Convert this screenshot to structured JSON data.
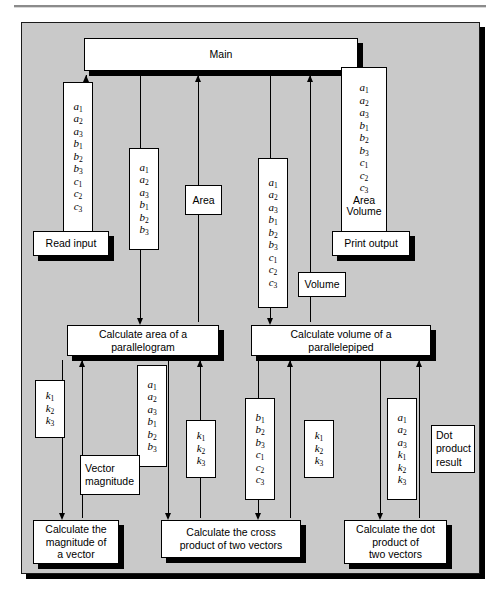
{
  "diagram": {
    "type": "structure-chart",
    "title_rule": "",
    "modules": {
      "main": "Main",
      "read_input": "Read input",
      "print_output": "Print output",
      "calc_area": "Calculate area of a\nparallelogram",
      "calc_area_l1": "Calculate area of a",
      "calc_area_l2": "parallelogram",
      "calc_volume_l1": "Calculate volume of a",
      "calc_volume_l2": "parallelepiped",
      "calc_magnitude_l1": "Calculate the",
      "calc_magnitude_l2": "magnitude of",
      "calc_magnitude_l3": "a vector",
      "calc_cross_l1": "Calculate the cross",
      "calc_cross_l2": "product of two vectors",
      "calc_dot_l1": "Calculate the dot",
      "calc_dot_l2": "product of",
      "calc_dot_l3": "two vectors"
    },
    "couples": {
      "read_input_out": [
        "a1",
        "a2",
        "a3",
        "b1",
        "b2",
        "b3",
        "c1",
        "c2",
        "c3"
      ],
      "area_in": [
        "a1",
        "a2",
        "a3",
        "b1",
        "b2",
        "b3"
      ],
      "area_out": "Area",
      "volume_in": [
        "a1",
        "a2",
        "a3",
        "b1",
        "b2",
        "b3",
        "c1",
        "c2",
        "c3"
      ],
      "volume_out": "Volume",
      "print_in": [
        "a1",
        "a2",
        "a3",
        "b1",
        "b2",
        "b3",
        "c1",
        "c2",
        "c3",
        "Area",
        "Volume"
      ],
      "magnitude_in_k": [
        "k1",
        "k2",
        "k3"
      ],
      "cross_in_ab": [
        "a1",
        "a2",
        "a3",
        "b1",
        "b2",
        "b3"
      ],
      "vector_magnitude": "Vector\nmagnitude",
      "vector_magnitude_l1": "Vector",
      "vector_magnitude_l2": "magnitude",
      "cross_out_k": [
        "k1",
        "k2",
        "k3"
      ],
      "cross_in_bc": [
        "b1",
        "b2",
        "b3",
        "c1",
        "c2",
        "c3"
      ],
      "cross_out_k2": [
        "k1",
        "k2",
        "k3"
      ],
      "dot_in": [
        "a1",
        "a2",
        "a3",
        "k1",
        "k2",
        "k3"
      ],
      "dot_result_l1": "Dot",
      "dot_result_l2": "product",
      "dot_result_l3": "result"
    },
    "colors": {
      "panel_background": "#c9c9c9",
      "node_fill": "#ffffff",
      "line": "#000000",
      "page": "#ffffff"
    }
  }
}
